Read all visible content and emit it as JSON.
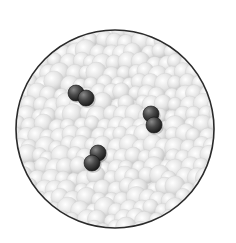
{
  "figure": {
    "width": 236,
    "height": 243,
    "container": {
      "shape": "circle",
      "cx": 115,
      "cy": 129,
      "r": 99,
      "stroke": "#2a2a2a",
      "fill": "#e6e6e6"
    },
    "solvent": {
      "color_light": "#fbfbfb",
      "color_mid": "#dcdcdc",
      "color_dark": "#b8b8b8",
      "particle_radius": 9
    },
    "solute_molecules": [
      {
        "atoms": [
          {
            "cx": 76,
            "cy": 93,
            "r": 8
          },
          {
            "cx": 86,
            "cy": 98,
            "r": 8
          }
        ]
      },
      {
        "atoms": [
          {
            "cx": 151,
            "cy": 114,
            "r": 8
          },
          {
            "cx": 154,
            "cy": 125,
            "r": 8
          }
        ]
      },
      {
        "atoms": [
          {
            "cx": 98,
            "cy": 153,
            "r": 8
          },
          {
            "cx": 92,
            "cy": 163,
            "r": 8
          }
        ]
      }
    ],
    "solute_color_light": "#7a7a7a",
    "solute_color_dark": "#1e1e1e"
  }
}
